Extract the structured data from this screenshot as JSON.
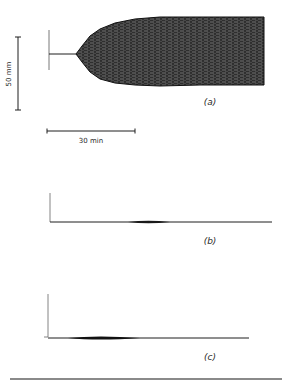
{
  "chart_data": {
    "type": "line",
    "title": "",
    "scale_bars": {
      "vertical": {
        "label": "50 mm",
        "length_px": 73
      },
      "horizontal": {
        "label": "30 min",
        "length_px": 88
      }
    },
    "panels": [
      {
        "id": "a",
        "label": "(a)",
        "baseline_y": 54,
        "marker": {
          "x": 49,
          "y_top": 30,
          "y_bottom": 70
        },
        "baseline": {
          "x_start": 49,
          "x_end": 76
        },
        "envelope": {
          "start_x": 76,
          "end_x": 264,
          "upper": [
            [
              76,
              54
            ],
            [
              82,
              46
            ],
            [
              90,
              36
            ],
            [
              100,
              29
            ],
            [
              115,
              23
            ],
            [
              135,
              19
            ],
            [
              160,
              17
            ],
            [
              200,
              17
            ],
            [
              264,
              17
            ]
          ],
          "lower": [
            [
              76,
              54
            ],
            [
              82,
              62
            ],
            [
              90,
              72
            ],
            [
              100,
              79
            ],
            [
              115,
              83
            ],
            [
              135,
              85
            ],
            [
              160,
              86
            ],
            [
              200,
              85
            ],
            [
              264,
              85
            ]
          ]
        },
        "fill_color": "#3a3a3a"
      },
      {
        "id": "b",
        "label": "(b)",
        "baseline_y": 222,
        "marker": {
          "x": 50,
          "y_top": 193,
          "y_bottom": 222
        },
        "baseline": {
          "x_start": 50,
          "x_end": 272
        },
        "thickening": {
          "x_start": 128,
          "x_peak": 148,
          "x_end": 170,
          "half_height": 1.3
        }
      },
      {
        "id": "c",
        "label": "(c)",
        "baseline_y": 338,
        "marker": {
          "x": 48,
          "y_top": 294,
          "y_bottom": 337,
          "tick_left": 4
        },
        "baseline": {
          "x_start": 48,
          "x_end": 249
        },
        "thickening": {
          "x_start": 68,
          "x_peak": 98,
          "x_end": 140,
          "half_height": 1.6
        }
      }
    ]
  },
  "labels": {
    "panel_a": "(a)",
    "panel_b": "(b)",
    "panel_c": "(c)",
    "scale_vertical": "50 mm",
    "scale_horizontal": "30 min"
  },
  "colors": {
    "ink": "#1f1f1f",
    "fill": "#3a3a3a",
    "rule": "#8a8a8a"
  }
}
